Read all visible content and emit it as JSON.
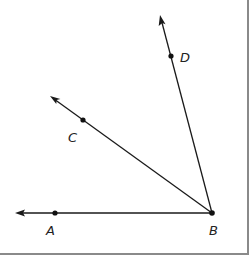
{
  "diagram": {
    "title": "",
    "vertex": {
      "label": "B",
      "x": 212,
      "y": 213
    },
    "rays": [
      {
        "name": "BA",
        "point_label": "A",
        "point": [
          55,
          213
        ],
        "tip": [
          15,
          213
        ],
        "label_pos": [
          46,
          235
        ]
      },
      {
        "name": "BC",
        "point_label": "C",
        "point": [
          83,
          120
        ],
        "tip": [
          50,
          96
        ],
        "label_pos": [
          68,
          142
        ]
      },
      {
        "name": "BD",
        "point_label": "D",
        "point": [
          171,
          56
        ],
        "tip": [
          160,
          15
        ],
        "label_pos": [
          180,
          62
        ]
      }
    ],
    "vertex_label_pos": [
      209,
      235
    ],
    "labels": {
      "A": "A",
      "B": "B",
      "C": "C",
      "D": "D"
    },
    "colors": {
      "line": "#1a1a1a",
      "border": "#8a8a8a",
      "background": "#ffffff"
    }
  }
}
